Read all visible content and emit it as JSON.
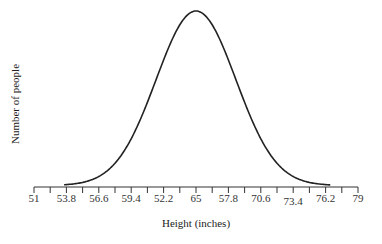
{
  "chart_data": {
    "type": "line",
    "title": "",
    "xlabel": "Height (inches)",
    "ylabel": "Number of people",
    "tick_labels": [
      "51",
      "53.8",
      "56.6",
      "59.4",
      "52.2",
      "65",
      "57.8",
      "70.6",
      "73.4",
      "76.2",
      "79"
    ],
    "xlim": [
      51,
      79
    ],
    "grid": false,
    "legend": null,
    "x": [
      53.8,
      55.2,
      56.6,
      58.0,
      59.4,
      60.8,
      62.2,
      63.6,
      65.0,
      66.4,
      67.8,
      69.2,
      70.6,
      72.0,
      73.4,
      74.8,
      76.2
    ],
    "values": [
      0.0,
      0.02,
      0.08,
      0.2,
      0.36,
      0.56,
      0.78,
      0.95,
      1.0,
      0.95,
      0.78,
      0.56,
      0.36,
      0.2,
      0.08,
      0.02,
      0.0
    ]
  },
  "axes": {
    "x_title": "Height (inches)",
    "y_title": "Number of people"
  }
}
